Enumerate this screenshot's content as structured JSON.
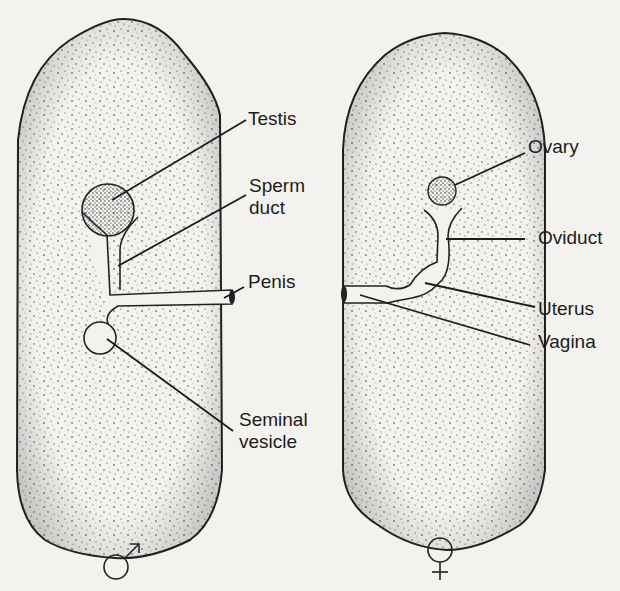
{
  "diagram": {
    "type": "labeled anatomical comparison",
    "bodies": [
      {
        "id": "male",
        "symbol": "♂",
        "labels": {
          "testis": "Testis",
          "sperm_duct_1": "Sperm",
          "sperm_duct_2": "duct",
          "penis": "Penis",
          "seminal_vesicle_1": "Seminal",
          "seminal_vesicle_2": "vesicle"
        }
      },
      {
        "id": "female",
        "symbol": "♀",
        "labels": {
          "ovary": "Ovary",
          "oviduct": "Oviduct",
          "uterus": "Uterus",
          "vagina": "Vagina"
        }
      }
    ],
    "colors": {
      "background": "#f3f2ef",
      "ink": "#1c1c1c",
      "organ_fill": "#f3f2ef"
    }
  }
}
